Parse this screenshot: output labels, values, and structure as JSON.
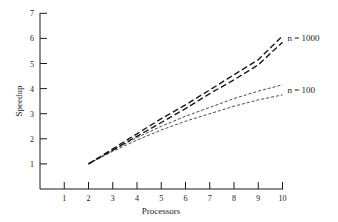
{
  "chart_data": {
    "type": "line",
    "title": "",
    "xlabel": "Processors",
    "ylabel": "Speedup",
    "xlim": [
      0,
      10
    ],
    "ylim": [
      0,
      7
    ],
    "x_ticks": [
      1,
      2,
      3,
      4,
      5,
      6,
      7,
      8,
      9,
      10
    ],
    "y_ticks": [
      1,
      2,
      3,
      4,
      5,
      6,
      7
    ],
    "grid": false,
    "legend": null,
    "x": [
      2,
      3,
      4,
      5,
      6,
      7,
      8,
      9,
      10
    ],
    "series": [
      {
        "name": "n = 1000 (upper)",
        "group": "n = 1000",
        "style": "long-dash",
        "values": [
          1.0,
          1.6,
          2.2,
          2.8,
          3.35,
          3.95,
          4.55,
          5.15,
          6.1
        ]
      },
      {
        "name": "n = 1000 (lower)",
        "group": "n = 1000",
        "style": "long-dash",
        "values": [
          1.0,
          1.55,
          2.1,
          2.65,
          3.2,
          3.8,
          4.35,
          4.95,
          5.85
        ]
      },
      {
        "name": "n = 100 (upper)",
        "group": "n = 100",
        "style": "short-dash",
        "values": [
          1.0,
          1.55,
          2.05,
          2.5,
          2.9,
          3.25,
          3.6,
          3.9,
          4.15
        ]
      },
      {
        "name": "n = 100 (lower)",
        "group": "n = 100",
        "style": "short-dash",
        "values": [
          1.0,
          1.5,
          1.95,
          2.35,
          2.7,
          3.0,
          3.3,
          3.55,
          3.75
        ]
      }
    ],
    "annotations": [
      {
        "text": "n = 1000",
        "x": 10,
        "y": 6.0
      },
      {
        "text": "n = 100",
        "x": 10,
        "y": 3.95
      }
    ]
  }
}
